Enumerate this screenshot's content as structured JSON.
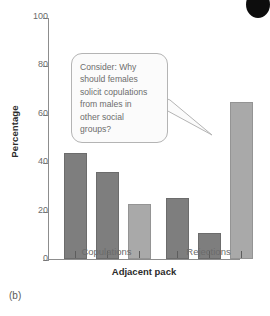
{
  "caption": "(b)",
  "annotation": {
    "icon": "black-circle-blob",
    "bubble_text": "Consider: Why\nshould females\nsolicit copulations\nfrom males in\nother social\ngroups?"
  },
  "colors": {
    "bar_dark": "#7e7e7e",
    "bar_light": "#a9a9a9",
    "axis": "#8d8d8d",
    "text": "#6b6b6b",
    "bubble_fill": "#fbfbfb",
    "bubble_stroke": "#b4b4b4"
  },
  "chart_data": {
    "type": "bar",
    "title": "",
    "xlabel": "Adjacent pack",
    "ylabel": "Percentage",
    "categories": [
      "Copulations",
      "Rejections"
    ],
    "ylim": [
      0,
      100
    ],
    "yticks": [
      0,
      20,
      40,
      60,
      80,
      100
    ],
    "ytick_labels": [
      "0",
      "20",
      "40",
      "60",
      "80",
      "100"
    ],
    "grid": false,
    "legend": "none",
    "series": [
      {
        "name": "Pack 1",
        "color": "#7e7e7e",
        "values": [
          43,
          24.5
        ]
      },
      {
        "name": "Pack 2",
        "color": "#7e7e7e",
        "values": [
          35,
          10
        ]
      },
      {
        "name": "Pack 3",
        "color": "#a9a9a9",
        "values": [
          22,
          64
        ]
      }
    ],
    "bars": [
      {
        "group": "Copulations",
        "index": 0,
        "value": 43,
        "shade": "dark"
      },
      {
        "group": "Copulations",
        "index": 1,
        "value": 35,
        "shade": "dark"
      },
      {
        "group": "Copulations",
        "index": 2,
        "value": 22,
        "shade": "light"
      },
      {
        "group": "Rejections",
        "index": 0,
        "value": 24.5,
        "shade": "dark"
      },
      {
        "group": "Rejections",
        "index": 1,
        "value": 10,
        "shade": "dark"
      },
      {
        "group": "Rejections",
        "index": 2,
        "value": 64,
        "shade": "light"
      }
    ]
  }
}
